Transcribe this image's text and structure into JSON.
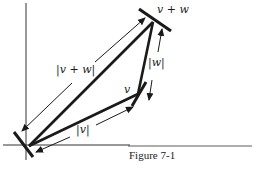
{
  "figure": {
    "caption": "Figure 7-1",
    "labels": {
      "v_plus_w_point": "v + w",
      "v_point": "v",
      "norm_v_plus_w": "|v + w|",
      "norm_w": "|w|",
      "norm_v": "|v|"
    },
    "points": {
      "origin": [
        29,
        146
      ],
      "v": [
        138,
        94
      ],
      "v_plus_w": [
        153,
        22
      ]
    },
    "colors": {
      "ink": "#1a1a1a",
      "background": "#ffffff"
    }
  }
}
